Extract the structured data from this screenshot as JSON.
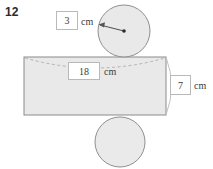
{
  "problem": {
    "number": "12"
  },
  "labels": {
    "radius": {
      "value": "3",
      "unit": "cm"
    },
    "length": {
      "value": "18",
      "unit": "cm"
    },
    "height": {
      "value": "7",
      "unit": "cm"
    }
  },
  "figure": {
    "kind": "cylinder-net",
    "fill_color": "#e8e8e8",
    "stroke_color": "#8c8c8c",
    "dash_color": "#b0b0b0",
    "arrow_color": "#555555",
    "top_circle": {
      "cx": 124,
      "cy": 31,
      "r": 26
    },
    "bottom_circle": {
      "cx": 120,
      "cy": 142,
      "r": 25
    },
    "rectangle": {
      "x": 24,
      "y": 57,
      "width": 142,
      "height": 58
    },
    "radius_arrow": {
      "from_x": 124,
      "from_y": 31,
      "to_x": 99,
      "to_y": 24
    }
  }
}
